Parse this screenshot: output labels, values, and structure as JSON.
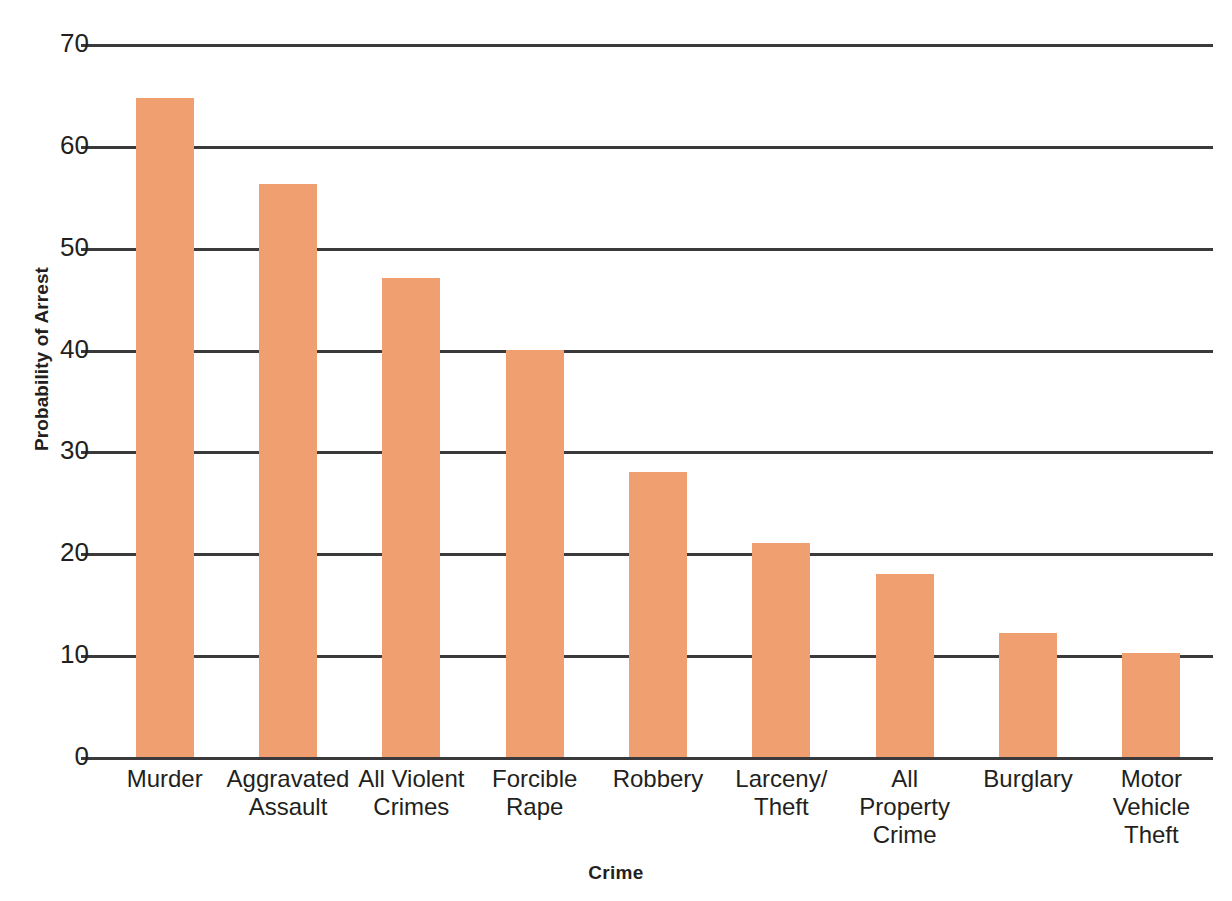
{
  "chart_data": {
    "type": "bar",
    "title": "",
    "xlabel": "Crime",
    "ylabel": "Probability of Arrest",
    "ylim": [
      0,
      70
    ],
    "ytick_step": 10,
    "yticks": [
      "0",
      "10",
      "20",
      "30",
      "40",
      "50",
      "60",
      "70"
    ],
    "grid": true,
    "legend": "none",
    "bar_color": "#f0a070",
    "axis_color": "#3a3a3c",
    "background": "#ffffff",
    "categories": [
      "Murder",
      "Aggravated Assault",
      "All Violent Crimes",
      "Forcible Rape",
      "Robbery",
      "Larceny/ Theft",
      "All Property Crime",
      "Burglary",
      "Motor Vehicle Theft"
    ],
    "category_lines": [
      [
        "Murder"
      ],
      [
        "Aggravated",
        "Assault"
      ],
      [
        "All Violent",
        "Crimes"
      ],
      [
        "Forcible",
        "Rape"
      ],
      [
        "Robbery"
      ],
      [
        "Larceny/",
        "Theft"
      ],
      [
        "All",
        "Property",
        "Crime"
      ],
      [
        "Burglary"
      ],
      [
        "Motor",
        "Vehicle",
        "Theft"
      ]
    ],
    "values": [
      64.7,
      56.3,
      47.0,
      40.0,
      28.0,
      21.0,
      18.0,
      12.2,
      10.2
    ]
  }
}
